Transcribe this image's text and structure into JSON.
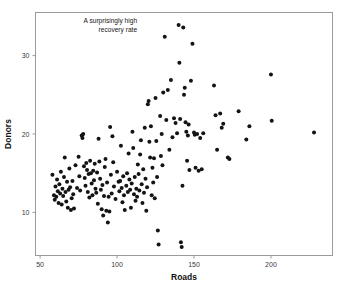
{
  "chart_data": {
    "type": "scatter",
    "title": "",
    "xlabel": "Roads",
    "ylabel": "Donors",
    "xlim": [
      47,
      240
    ],
    "ylim": [
      4.5,
      35.5
    ],
    "xticks": [
      50,
      100,
      150,
      200
    ],
    "yticks": [
      10,
      20,
      30
    ],
    "xtick_labels": [
      "50",
      "100",
      "150",
      "200"
    ],
    "ytick_labels": [
      "10",
      "20",
      "30"
    ],
    "grid": false,
    "legend": "none",
    "marker": "filled-circle",
    "marker_color": "#141414",
    "marker_size_px": 2.0,
    "annotations": [
      {
        "name": "recovery-rate-annotation",
        "line1": "A surprisingly high",
        "line2": "recovery rate",
        "x_data": 113,
        "y_data": 34.2
      }
    ],
    "points": [
      [
        58,
        14.8
      ],
      [
        59,
        12.2
      ],
      [
        59.5,
        11.6
      ],
      [
        60,
        13.3
      ],
      [
        60.5,
        12.0
      ],
      [
        61,
        14.2
      ],
      [
        61.5,
        12.7
      ],
      [
        62,
        11.2
      ],
      [
        62.5,
        13.6
      ],
      [
        63,
        12.4
      ],
      [
        63.5,
        15.2
      ],
      [
        64,
        11.0
      ],
      [
        64.5,
        13.0
      ],
      [
        65,
        12.1
      ],
      [
        65.5,
        14.5
      ],
      [
        66,
        17.0
      ],
      [
        66.5,
        12.6
      ],
      [
        67,
        11.4
      ],
      [
        67.5,
        13.9
      ],
      [
        68,
        10.6
      ],
      [
        68.5,
        12.9
      ],
      [
        69,
        15.6
      ],
      [
        69.5,
        13.2
      ],
      [
        70,
        10.3
      ],
      [
        70.5,
        11.8
      ],
      [
        71,
        14.0
      ],
      [
        71.5,
        12.3
      ],
      [
        72,
        10.5
      ],
      [
        73,
        16.0
      ],
      [
        74,
        13.1
      ],
      [
        75,
        17.1
      ],
      [
        75.5,
        14.6
      ],
      [
        76,
        12.8
      ],
      [
        77,
        19.8
      ],
      [
        77.5,
        19.5
      ],
      [
        78,
        20.0
      ],
      [
        78.5,
        15.9
      ],
      [
        79,
        14.4
      ],
      [
        79.5,
        13.4
      ],
      [
        80,
        16.3
      ],
      [
        80.5,
        15.4
      ],
      [
        81,
        12.6
      ],
      [
        81.5,
        14.9
      ],
      [
        82,
        11.9
      ],
      [
        82.5,
        16.6
      ],
      [
        83,
        15.0
      ],
      [
        83.5,
        13.7
      ],
      [
        84,
        12.2
      ],
      [
        84.5,
        15.3
      ],
      [
        85,
        14.1
      ],
      [
        85.5,
        16.2
      ],
      [
        86,
        13.0
      ],
      [
        86.5,
        12.5
      ],
      [
        87,
        15.1
      ],
      [
        87.5,
        11.1
      ],
      [
        88,
        19.4
      ],
      [
        88.5,
        16.5
      ],
      [
        89,
        14.3
      ],
      [
        89.5,
        12.9
      ],
      [
        90,
        10.4
      ],
      [
        90.5,
        13.5
      ],
      [
        91,
        9.6
      ],
      [
        91.5,
        12.1
      ],
      [
        92,
        15.8
      ],
      [
        92.5,
        16.8
      ],
      [
        93,
        10.2
      ],
      [
        93.5,
        13.8
      ],
      [
        94,
        8.7
      ],
      [
        94.5,
        12.0
      ],
      [
        95,
        10.1
      ],
      [
        95.5,
        20.9
      ],
      [
        96,
        14.8
      ],
      [
        96.5,
        12.4
      ],
      [
        97,
        19.7
      ],
      [
        97.5,
        16.4
      ],
      [
        98,
        13.3
      ],
      [
        99,
        11.7
      ],
      [
        100,
        15.2
      ],
      [
        101,
        13.9
      ],
      [
        101.5,
        12.7
      ],
      [
        102,
        14.0
      ],
      [
        102.5,
        18.5
      ],
      [
        103,
        13.1
      ],
      [
        103.5,
        11.3
      ],
      [
        104,
        14.6
      ],
      [
        104.5,
        12.2
      ],
      [
        105,
        10.3
      ],
      [
        106,
        13.4
      ],
      [
        106.5,
        15.0
      ],
      [
        107,
        12.6
      ],
      [
        107.5,
        17.5
      ],
      [
        108,
        14.2
      ],
      [
        108.5,
        12.9
      ],
      [
        109,
        10.6
      ],
      [
        109.5,
        13.7
      ],
      [
        110,
        20.3
      ],
      [
        110.5,
        18.2
      ],
      [
        111,
        12.3
      ],
      [
        111.5,
        14.5
      ],
      [
        112,
        11.5
      ],
      [
        112.5,
        13.0
      ],
      [
        113,
        12.0
      ],
      [
        113.5,
        16.1
      ],
      [
        114,
        14.9
      ],
      [
        114.5,
        12.8
      ],
      [
        115,
        17.4
      ],
      [
        115.5,
        19.2
      ],
      [
        116,
        13.6
      ],
      [
        116.5,
        11.2
      ],
      [
        117,
        15.5
      ],
      [
        117.5,
        12.5
      ],
      [
        118,
        20.8
      ],
      [
        118.5,
        14.3
      ],
      [
        119,
        10.2
      ],
      [
        119.5,
        13.2
      ],
      [
        120,
        23.8
      ],
      [
        120.5,
        24.2
      ],
      [
        121,
        19.0
      ],
      [
        121.5,
        17.0
      ],
      [
        122,
        21.0
      ],
      [
        122.5,
        12.2
      ],
      [
        123,
        15.7
      ],
      [
        123.5,
        13.8
      ],
      [
        124,
        16.9
      ],
      [
        124.5,
        11.8
      ],
      [
        125,
        24.6
      ],
      [
        125.5,
        19.1
      ],
      [
        126,
        14.5
      ],
      [
        126.5,
        7.7
      ],
      [
        127,
        5.9
      ],
      [
        128,
        22.3
      ],
      [
        128.5,
        17.2
      ],
      [
        129,
        20.0
      ],
      [
        129.5,
        16.0
      ],
      [
        130,
        25.3
      ],
      [
        131,
        32.4
      ],
      [
        132,
        21.8
      ],
      [
        133,
        25.6
      ],
      [
        134,
        18.0
      ],
      [
        135,
        26.9
      ],
      [
        136,
        19.6
      ],
      [
        137,
        22.0
      ],
      [
        138,
        21.4
      ],
      [
        139,
        20.1
      ],
      [
        140,
        33.9
      ],
      [
        140.5,
        29.1
      ],
      [
        141,
        21.9
      ],
      [
        141.5,
        6.2
      ],
      [
        142,
        5.6
      ],
      [
        142.5,
        13.4
      ],
      [
        143,
        33.6
      ],
      [
        143.5,
        25.0
      ],
      [
        144,
        25.9
      ],
      [
        144.5,
        21.5
      ],
      [
        145,
        20.3
      ],
      [
        145.5,
        16.6
      ],
      [
        146,
        19.8
      ],
      [
        146.5,
        21.2
      ],
      [
        147,
        15.4
      ],
      [
        148,
        26.8
      ],
      [
        149,
        31.5
      ],
      [
        150,
        20.2
      ],
      [
        150.5,
        19.9
      ],
      [
        151,
        15.7
      ],
      [
        152,
        20.0
      ],
      [
        153,
        15.3
      ],
      [
        154,
        19.5
      ],
      [
        155,
        15.5
      ],
      [
        156,
        20.1
      ],
      [
        163,
        26.2
      ],
      [
        164,
        22.4
      ],
      [
        165,
        18.0
      ],
      [
        167,
        22.6
      ],
      [
        168,
        20.8
      ],
      [
        169,
        21.3
      ],
      [
        172,
        17.0
      ],
      [
        173,
        16.8
      ],
      [
        179,
        22.9
      ],
      [
        184,
        19.3
      ],
      [
        186,
        21.0
      ],
      [
        200,
        27.6
      ],
      [
        200.5,
        21.7
      ],
      [
        228,
        20.2
      ]
    ]
  },
  "caption": {
    "text": ""
  }
}
